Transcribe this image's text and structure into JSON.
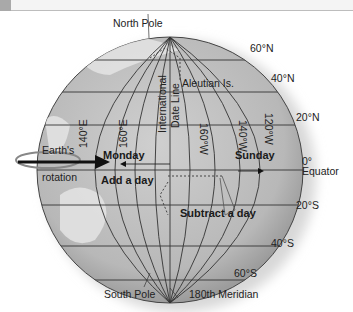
{
  "header": {
    "text": ""
  },
  "diagram": {
    "poles": {
      "north": "North Pole",
      "south": "South Pole"
    },
    "latitudes": [
      "60°N",
      "40°N",
      "20°N",
      "0°",
      "20°S",
      "40°S",
      "60°S"
    ],
    "equator_label": "Equator",
    "longitudes": [
      "140°E",
      "160°E",
      "160°W",
      "140°W",
      "120°W"
    ],
    "date_line_label_1": "International",
    "date_line_label_2": "Date Line",
    "aleutian": "Aleutian Is.",
    "rotation_1": "Earth's",
    "rotation_2": "rotation",
    "monday": "Monday",
    "sunday": "Sunday",
    "add_day": "Add a day",
    "subtract_day": "Subtract a day",
    "meridian_180": "180th Meridian",
    "colors": {
      "globe": "#bdbdbd",
      "grid": "#333333",
      "land": "#e2e2e2",
      "text": "#222222"
    }
  }
}
